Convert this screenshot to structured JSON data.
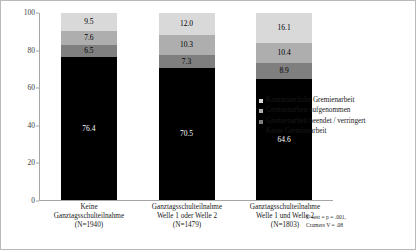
{
  "chart_data": {
    "type": "bar",
    "subtype": "stacked-percent",
    "title": "",
    "xlabel": "",
    "ylabel": "Angaben in Prozent",
    "ylim": [
      0,
      100
    ],
    "yticks": [
      0,
      20,
      40,
      60,
      80,
      100
    ],
    "grid": false,
    "legend_position": "right",
    "categories": [
      "Keine\nGanztagsschulteilnahme\n(N=1940)",
      "Ganztagsschulteilnahme\nWelle 1 oder Welle 2\n(N=1479)",
      "Ganztagsschulteilnahme\nWelle 1 und Welle 2\n(N=1803)"
    ],
    "category_lines": [
      [
        "Keine",
        "Ganztagsschulteilnahme",
        "(N=1940)"
      ],
      [
        "Ganztagsschulteilnahme",
        "Welle 1 oder Welle 2",
        "(N=1479)"
      ],
      [
        "Ganztagsschulteilnahme",
        "Welle 1 und Welle 2",
        "(N=1803)"
      ]
    ],
    "series": [
      {
        "name": "Keine Gremienarbeit",
        "color": "#000000",
        "text_color": "#ffffff",
        "values": [
          76.4,
          70.5,
          64.6
        ],
        "labels": [
          "76.4",
          "70.5",
          "64.6"
        ]
      },
      {
        "name": "Gremienarbeit beendet / verringert",
        "color": "#7f7f7f",
        "text_color": "#000000",
        "values": [
          6.5,
          7.3,
          8.9
        ],
        "labels": [
          "6.5",
          "7.3",
          "8.9"
        ]
      },
      {
        "name": "Gremienarbeit aufgenommen",
        "color": "#aeaeae",
        "text_color": "#000000",
        "values": [
          7.6,
          10.3,
          10.4
        ],
        "labels": [
          "7.6",
          "10.3",
          "10.4"
        ]
      },
      {
        "name": "Kontinuierliche Gremienarbeit",
        "color": "#d9d9d9",
        "text_color": "#000000",
        "values": [
          9.5,
          12.0,
          16.1
        ],
        "labels": [
          "9.5",
          "12.0",
          "16.1"
        ]
      }
    ],
    "legend_entries": [
      {
        "label": "Kontinuierliche Gremienarbeit",
        "color": "#d9d9d9"
      },
      {
        "label": "Gremienarbeit aufgenommen",
        "color": "#aeaeae"
      },
      {
        "label": "Gremienarbeit beendet / verringert",
        "color": "#7f7f7f"
      },
      {
        "label": "Keine Gremienarbeit",
        "color": "#000000"
      }
    ],
    "annotations": {
      "stats_line_1": "x²-test = p = .001,",
      "stats_line_2": "Cramers V = .08"
    }
  }
}
